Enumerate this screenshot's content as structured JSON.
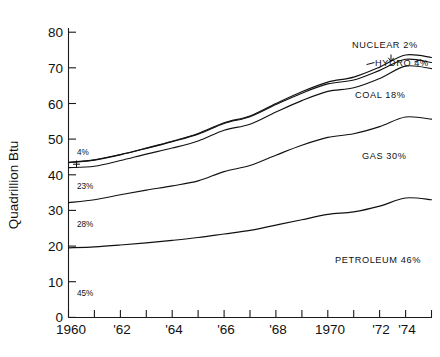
{
  "chart_data": {
    "type": "line",
    "title": "",
    "subtitle": "",
    "xlabel": "",
    "ylabel": "Quadrillion Btu",
    "xlim": [
      1960,
      1974
    ],
    "ylim": [
      0,
      85
    ],
    "ytick_values": [
      0,
      10,
      20,
      30,
      40,
      50,
      60,
      70,
      80
    ],
    "ytick_labels": [
      "0",
      "10",
      "20",
      "30",
      "40",
      "50",
      "60",
      "70",
      "80"
    ],
    "xtick_values": [
      1960,
      1961,
      1962,
      1963,
      1964,
      1965,
      1966,
      1967,
      1968,
      1969,
      1970,
      1971,
      1972,
      1973,
      1974
    ],
    "xtick_labels": [
      "1960",
      "",
      "'62",
      "",
      "'64",
      "",
      "'66",
      "",
      "'68",
      "",
      "1970",
      "",
      "'72",
      "",
      "'74"
    ],
    "grid": false,
    "legend_position": "inline-annotations",
    "stacked": true,
    "note": "Cumulative (stacked) curves of U.S. energy consumption by source; topmost curve is the total of all sources.",
    "x": [
      1960,
      1961,
      1962,
      1963,
      1964,
      1965,
      1966,
      1967,
      1968,
      1969,
      1970,
      1971,
      1972,
      1973,
      1974
    ],
    "series": [
      {
        "name": "Petroleum",
        "label": "PETROLEUM 46%",
        "share_start_pct": "45%",
        "share_end_pct": "46%",
        "cumulative_values": [
          19.5,
          19.8,
          20.3,
          20.9,
          21.6,
          22.4,
          23.4,
          24.4,
          25.9,
          27.4,
          28.9,
          29.6,
          31.2,
          33.5,
          33.0
        ]
      },
      {
        "name": "Gas",
        "label": "GAS 30%",
        "share_start_pct": "28%",
        "share_end_pct": "30%",
        "cumulative_values": [
          32.2,
          33.0,
          34.4,
          35.7,
          36.9,
          38.3,
          40.9,
          42.6,
          45.5,
          48.3,
          50.5,
          51.5,
          53.5,
          56.2,
          55.6
        ]
      },
      {
        "name": "Coal",
        "label": "COAL 18%",
        "share_start_pct": "23%",
        "share_end_pct": "18%",
        "cumulative_values": [
          42.0,
          42.4,
          44.0,
          45.8,
          47.5,
          49.5,
          52.5,
          54.2,
          57.6,
          60.8,
          63.4,
          64.4,
          67.0,
          70.5,
          69.8
        ]
      },
      {
        "name": "Hydro",
        "label": "HYDRO 4%",
        "share_start_pct": "4%",
        "share_end_pct": "4%",
        "cumulative_values": [
          43.4,
          44.1,
          45.6,
          47.4,
          49.3,
          51.4,
          54.4,
          56.3,
          59.7,
          62.9,
          65.5,
          66.6,
          69.3,
          72.4,
          71.5
        ]
      },
      {
        "name": "Nuclear",
        "label": "NUCLEAR 2%",
        "share_start_pct": "",
        "share_end_pct": "2%",
        "cumulative_values": [
          43.5,
          44.2,
          45.7,
          47.5,
          49.4,
          51.6,
          54.6,
          56.5,
          60.0,
          63.3,
          66.0,
          67.4,
          70.2,
          73.6,
          72.9
        ]
      }
    ],
    "annotations": [
      {
        "id": "nuclear",
        "text": "NUCLEAR 2%",
        "kind": "series-label"
      },
      {
        "id": "hydro",
        "text": "HYDRO 4%",
        "kind": "series-label"
      },
      {
        "id": "coal",
        "text": "COAL 18%",
        "kind": "series-label"
      },
      {
        "id": "gas",
        "text": "GAS 30%",
        "kind": "series-label"
      },
      {
        "id": "petroleum",
        "text": "PETROLEUM 46%",
        "kind": "series-label"
      },
      {
        "id": "hydro-start",
        "text": "4%",
        "kind": "share-start"
      },
      {
        "id": "coal-start",
        "text": "23%",
        "kind": "share-start"
      },
      {
        "id": "gas-start",
        "text": "28%",
        "kind": "share-start"
      },
      {
        "id": "petroleum-start",
        "text": "45%",
        "kind": "share-start"
      }
    ],
    "colors": {
      "line": "#111111",
      "axis": "#1a1a1a",
      "background": "#ffffff"
    }
  }
}
